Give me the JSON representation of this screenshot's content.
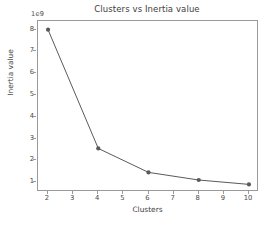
{
  "chart_data": {
    "type": "line",
    "title": "Clusters vs Inertia value",
    "xlabel": "Clusters",
    "ylabel": "Inertia value",
    "y_offset_label": "1e9",
    "y_scale": 1000000000,
    "x": [
      2,
      4,
      6,
      8,
      10
    ],
    "values": [
      8000000000,
      2550000000,
      1450000000,
      1100000000,
      900000000
    ],
    "values_scaled": [
      8.0,
      2.55,
      1.45,
      1.1,
      0.9
    ],
    "xlim": [
      1.6,
      10.4
    ],
    "ylim": [
      0.55,
      8.4
    ],
    "xticks": [
      2,
      3,
      4,
      5,
      6,
      7,
      8,
      9,
      10
    ],
    "yticks": [
      1,
      2,
      3,
      4,
      5,
      6,
      7,
      8
    ],
    "xticklabels": [
      "2",
      "3",
      "4",
      "5",
      "6",
      "7",
      "8",
      "9",
      "10"
    ],
    "yticklabels": [
      "1",
      "2",
      "3",
      "4",
      "5",
      "6",
      "7",
      "8"
    ],
    "grid": false,
    "legend": false,
    "line_color": "#5a5a5a",
    "marker": "circle",
    "marker_color": "#5a5a5a",
    "frame_color": "#9a9a9a",
    "background": "#ffffff"
  }
}
